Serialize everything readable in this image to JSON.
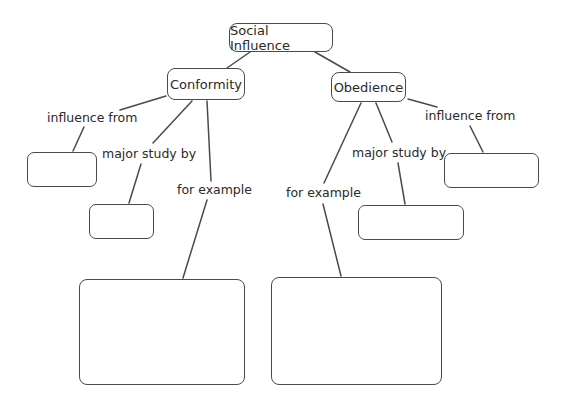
{
  "diagram": {
    "type": "concept-map",
    "root": {
      "label": "Social Influence"
    },
    "branches": [
      {
        "label": "Conformity",
        "links": [
          {
            "label": "influence from",
            "target": ""
          },
          {
            "label": "major study by",
            "target": ""
          },
          {
            "label": "for example",
            "target": ""
          }
        ]
      },
      {
        "label": "Obedience",
        "links": [
          {
            "label": "influence from",
            "target": ""
          },
          {
            "label": "major study by",
            "target": ""
          },
          {
            "label": "for example",
            "target": ""
          }
        ]
      }
    ],
    "colors": {
      "stroke": "#4a4a4a",
      "text": "#2a2a2a",
      "background": "#ffffff"
    }
  }
}
